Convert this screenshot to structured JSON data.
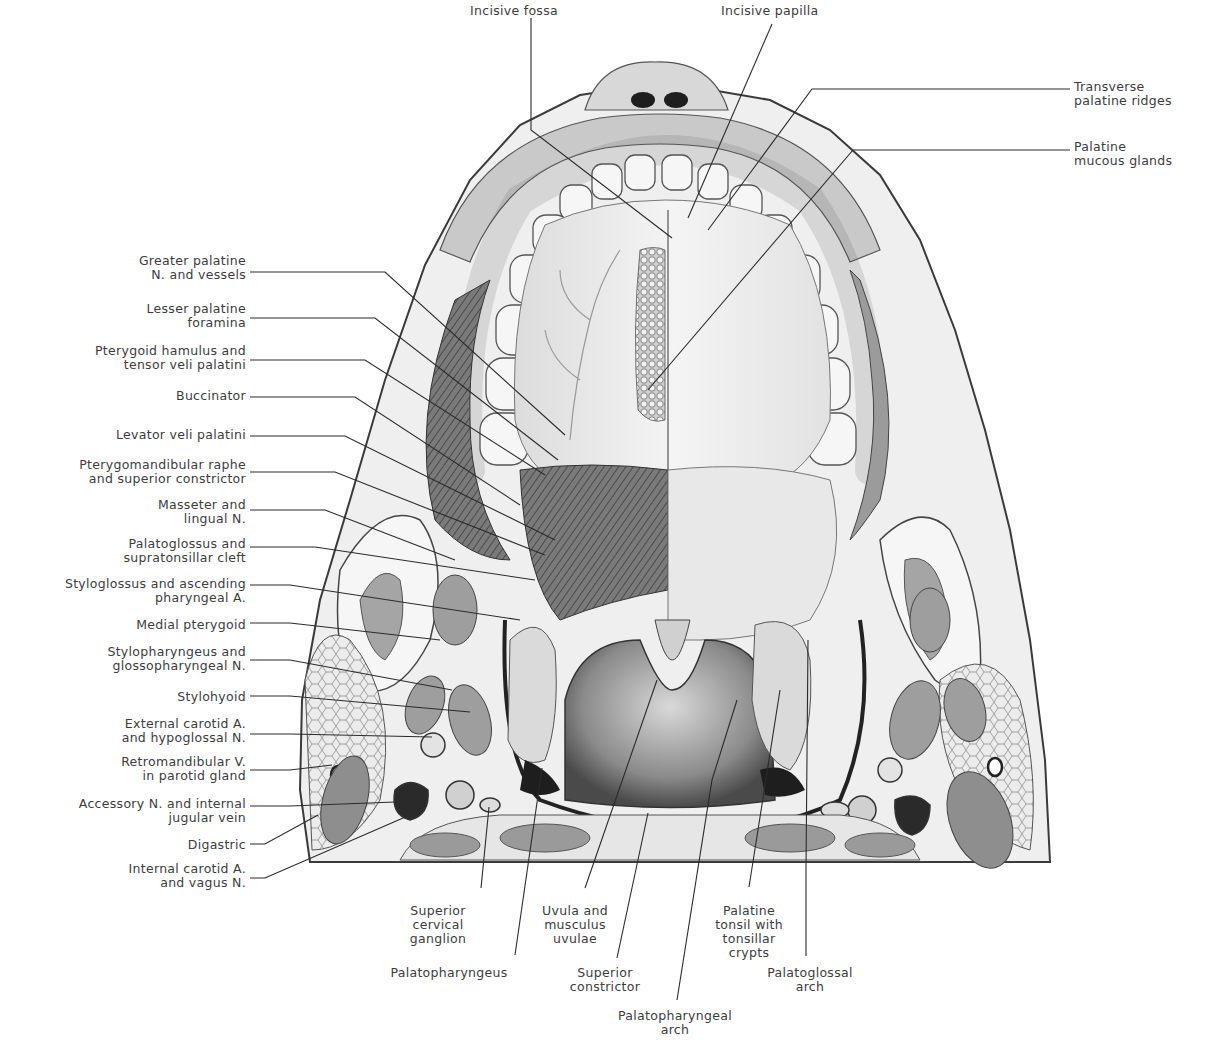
{
  "figure": {
    "colors": {
      "background": "#ffffff",
      "ink": "#2b2b2b",
      "tissue_light": "#ececec",
      "tissue_mid": "#bdbdbd",
      "tissue_dark": "#6a6a6a",
      "cavity": "#9a9a9a",
      "text": "#3c3c3c"
    }
  },
  "labels": {
    "top": [
      {
        "id": "incisive-fossa",
        "text": "Incisive fossa",
        "x": 470,
        "y": 4,
        "align": "left",
        "line": "M 531 18 L 531 130 L 672 238"
      },
      {
        "id": "incisive-papilla",
        "text": "Incisive papilla",
        "x": 721,
        "y": 4,
        "align": "left",
        "line": "M 772 24 L 688 218"
      }
    ],
    "right": [
      {
        "id": "transverse-palatine-ridges",
        "text": "Transverse\npalatine ridges",
        "x": 1074,
        "y": 80,
        "align": "left",
        "line": "M 1070 89 L 812 89 L 708 230"
      },
      {
        "id": "palatine-mucous-glands",
        "text": "Palatine\nmucous glands",
        "x": 1074,
        "y": 140,
        "align": "left",
        "line": "M 1070 150 L 853 150 L 648 390"
      }
    ],
    "left": [
      {
        "id": "greater-palatine-n-and-vessels",
        "text": "Greater palatine\nN. and vessels",
        "x": 10,
        "y": 254,
        "align": "right",
        "line": "M 250 272 L 385 272 L 565 435"
      },
      {
        "id": "lesser-palatine-foramina",
        "text": "Lesser palatine\nforamina",
        "x": 10,
        "y": 302,
        "align": "right",
        "line": "M 250 318 L 375 318 L 558 460"
      },
      {
        "id": "pterygoid-hamulus-and-tensor-veli-palatini",
        "text": "Pterygoid hamulus and\ntensor veli palatini",
        "x": 10,
        "y": 344,
        "align": "right",
        "line": "M 250 360 L 365 360 L 545 475"
      },
      {
        "id": "buccinator",
        "text": "Buccinator",
        "x": 10,
        "y": 389,
        "align": "right",
        "line": "M 250 397 L 355 397 L 520 505"
      },
      {
        "id": "levator-veli-palatini",
        "text": "Levator veli palatini",
        "x": 10,
        "y": 428,
        "align": "right",
        "line": "M 250 436 L 345 436 L 555 540"
      },
      {
        "id": "pterygomandibular-raphe-and-superior-constrictor",
        "text": "Pterygomandibular raphe\nand superior constrictor",
        "x": 10,
        "y": 458,
        "align": "right",
        "line": "M 250 472 L 335 472 L 545 555"
      },
      {
        "id": "masseter-and-lingual-n",
        "text": "Masseter and\nlingual N.",
        "x": 10,
        "y": 498,
        "align": "right",
        "line": "M 250 510 L 325 510 L 455 560"
      },
      {
        "id": "palatoglossus-and-supratonsillar-cleft",
        "text": "Palatoglossus and\nsupratonsillar cleft",
        "x": 10,
        "y": 537,
        "align": "right",
        "line": "M 250 547 L 315 547 L 535 580"
      },
      {
        "id": "styloglossus-and-ascending-pharyngeal-a",
        "text": "Styloglossus and ascending\npharyngeal A.",
        "x": 10,
        "y": 577,
        "align": "right",
        "line": "M 250 585 L 290 585 L 520 620"
      },
      {
        "id": "medial-pterygoid",
        "text": "Medial pterygoid",
        "x": 10,
        "y": 618,
        "align": "right",
        "line": "M 250 623 L 290 623 L 440 640"
      },
      {
        "id": "stylopharyngeus-and-glossopharyngeal-n",
        "text": "Stylopharyngeus and\nglossopharyngeal N.",
        "x": 10,
        "y": 645,
        "align": "right",
        "line": "M 250 660 L 290 660 L 452 690"
      },
      {
        "id": "stylohyoid",
        "text": "Stylohyoid",
        "x": 10,
        "y": 690,
        "align": "right",
        "line": "M 250 696 L 290 696 L 470 712"
      },
      {
        "id": "external-carotid-a-and-hypoglossal-n",
        "text": "External carotid A.\nand hypoglossal N.",
        "x": 10,
        "y": 717,
        "align": "right",
        "line": "M 250 734 L 290 734 L 432 737"
      },
      {
        "id": "retromandibular-v-in-parotid-gland",
        "text": "Retromandibular V.\nin parotid gland",
        "x": 10,
        "y": 755,
        "align": "right",
        "line": "M 250 770 L 290 770 L 332 765"
      },
      {
        "id": "accessory-n-and-internal-jugular-vein",
        "text": "Accessory N. and internal\njugular vein",
        "x": 10,
        "y": 797,
        "align": "right",
        "line": "M 250 806 L 290 806 L 395 802"
      },
      {
        "id": "digastric",
        "text": "Digastric",
        "x": 10,
        "y": 838,
        "align": "right",
        "line": "M 250 844 L 265 844 L 318 815"
      },
      {
        "id": "internal-carotid-a-and-vagus-n",
        "text": "Internal carotid A.\nand vagus N.",
        "x": 10,
        "y": 862,
        "align": "right",
        "line": "M 250 878 L 265 878 L 410 815"
      }
    ],
    "bottom": [
      {
        "id": "superior-cervical-ganglion",
        "text": "Superior\ncervical\nganglion",
        "x": 402,
        "y": 904,
        "align": "center",
        "w": 72,
        "line": "M 481 888 L 489 807"
      },
      {
        "id": "palatopharyngeus",
        "text": "Palatopharyngeus",
        "x": 384,
        "y": 966,
        "align": "center",
        "w": 130,
        "line": "M 515 955 L 542 768"
      },
      {
        "id": "uvula-and-musculus-uvulae",
        "text": "Uvula and\nmusculus\nuvulae",
        "x": 530,
        "y": 904,
        "align": "center",
        "w": 90,
        "line": "M 585 888 L 657 680"
      },
      {
        "id": "superior-constrictor",
        "text": "Superior\nconstrictor",
        "x": 560,
        "y": 966,
        "align": "center",
        "w": 90,
        "line": "M 617 958 L 648 813"
      },
      {
        "id": "palatopharyngeal-arch",
        "text": "Palatopharyngeal\narch",
        "x": 600,
        "y": 1009,
        "align": "center",
        "w": 150,
        "line": "M 677 1000 L 712 780 L 737 700"
      },
      {
        "id": "palatine-tonsil-with-tonsillar-crypts",
        "text": "Palatine\ntonsil with\ntonsillar\ncrypts",
        "x": 704,
        "y": 904,
        "align": "center",
        "w": 90,
        "line": "M 749 887 L 780 690"
      },
      {
        "id": "palatoglossal-arch",
        "text": "Palatoglossal\narch",
        "x": 755,
        "y": 966,
        "align": "center",
        "w": 110,
        "line": "M 806 956 L 806 870 L 808 640"
      }
    ]
  }
}
